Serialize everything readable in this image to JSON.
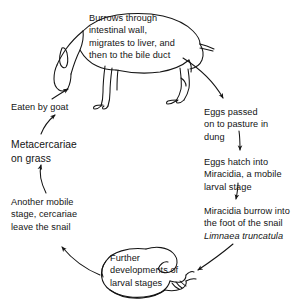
{
  "diagram": {
    "type": "cycle-diagram",
    "background_color": "#ffffff",
    "ink_color": "#141414",
    "labels": {
      "burrows": "Burrows through\nintestinal wall,\nmigrates to liver, and\nthen to the bile duct",
      "eaten_by_goat": "Eaten by goat",
      "metacercariae": "Metacercariae\non grass",
      "eggs_passed": "Eggs passed\non to pasture in\ndung",
      "eggs_hatch": "Eggs hatch into\nMiracidia, a mobile\nlarval stage",
      "miracidia_burrow_line1": "Miracidia burrow into",
      "miracidia_burrow_line2": "the foot of the snail",
      "miracidia_burrow_species": "Limnaea truncatula",
      "another_mobile": "Another mobile\nstage, cercariae\nleave the snail",
      "further_developments": "Further\ndevelopments of\nlarval stages"
    },
    "figures": [
      {
        "name": "goat",
        "description": "line drawing of a grazing goat"
      },
      {
        "name": "snail",
        "description": "line drawing of a snail"
      }
    ],
    "arrows": [
      {
        "name": "arrow-metacercariae-to-eaten",
        "from": "metacercariae",
        "to": "eaten_by_goat"
      },
      {
        "name": "arrow-eaten-to-goat",
        "from": "eaten_by_goat",
        "to": "goat"
      },
      {
        "name": "arrow-goat-to-eggs-passed",
        "from": "goat",
        "to": "eggs_passed"
      },
      {
        "name": "arrow-eggs-passed-to-eggs-hatch",
        "from": "eggs_passed",
        "to": "eggs_hatch"
      },
      {
        "name": "arrow-eggs-hatch-to-miracidia",
        "from": "eggs_hatch",
        "to": "miracidia_burrow"
      },
      {
        "name": "arrow-miracidia-to-snail",
        "from": "miracidia_burrow",
        "to": "snail"
      },
      {
        "name": "arrow-snail-to-another-mobile",
        "from": "snail",
        "to": "another_mobile"
      },
      {
        "name": "arrow-another-mobile-to-metacercariae",
        "from": "another_mobile",
        "to": "metacercariae"
      }
    ]
  }
}
